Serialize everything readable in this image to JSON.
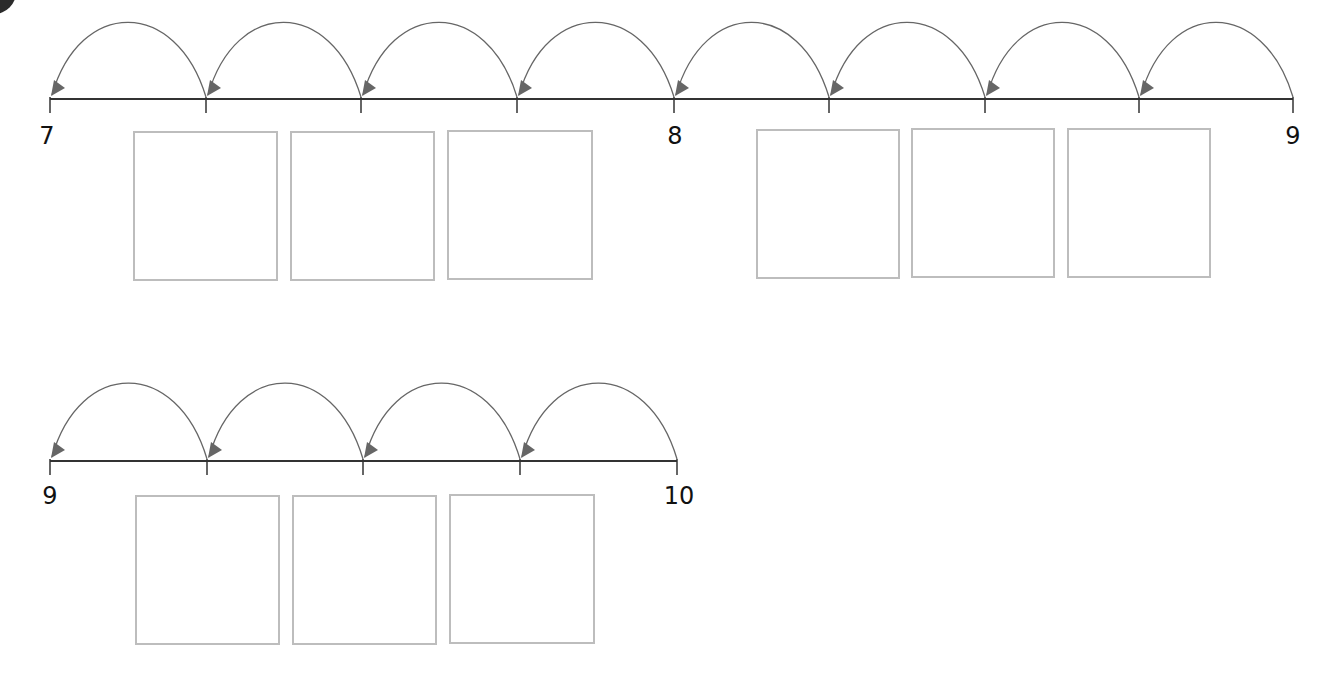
{
  "worksheet": {
    "number_lines": [
      {
        "id": "line-7-to-9",
        "start": 7,
        "end": 9,
        "labels": [
          {
            "text": "7",
            "x": 47,
            "y": 124
          },
          {
            "text": "8",
            "x": 675,
            "y": 124
          },
          {
            "text": "9",
            "x": 1293,
            "y": 124
          }
        ],
        "axis": {
          "x1": 50,
          "x2": 1293,
          "y": 99
        },
        "ticks": [
          50,
          206,
          361,
          517,
          674,
          829,
          985,
          1139,
          1293
        ],
        "jumps_direction": "left",
        "jump_count": 8,
        "arc_peak_y": 33
      },
      {
        "id": "line-9-to-10",
        "start": 9,
        "end": 10,
        "labels": [
          {
            "text": "9",
            "x": 50,
            "y": 484
          },
          {
            "text": "10",
            "x": 679,
            "y": 484
          }
        ],
        "axis": {
          "x1": 50,
          "x2": 677,
          "y": 461
        },
        "ticks": [
          50,
          207,
          363,
          520,
          677
        ],
        "jumps_direction": "left",
        "jump_count": 4,
        "arc_peak_y": 394
      }
    ],
    "answer_boxes": [
      {
        "x": 133,
        "y": 131,
        "w": 145,
        "h": 150,
        "value": ""
      },
      {
        "x": 290,
        "y": 131,
        "w": 145,
        "h": 150,
        "value": ""
      },
      {
        "x": 447,
        "y": 130,
        "w": 146,
        "h": 150,
        "value": ""
      },
      {
        "x": 756,
        "y": 129,
        "w": 144,
        "h": 150,
        "value": ""
      },
      {
        "x": 911,
        "y": 128,
        "w": 144,
        "h": 150,
        "value": ""
      },
      {
        "x": 1067,
        "y": 128,
        "w": 144,
        "h": 150,
        "value": ""
      },
      {
        "x": 135,
        "y": 495,
        "w": 145,
        "h": 150,
        "value": ""
      },
      {
        "x": 292,
        "y": 495,
        "w": 145,
        "h": 150,
        "value": ""
      },
      {
        "x": 449,
        "y": 494,
        "w": 146,
        "h": 150,
        "value": ""
      }
    ],
    "colors": {
      "line": "#333333",
      "arc": "#666666",
      "arrowhead": "#666666",
      "box_border": "#bdbdbd",
      "label": "#111111"
    }
  }
}
